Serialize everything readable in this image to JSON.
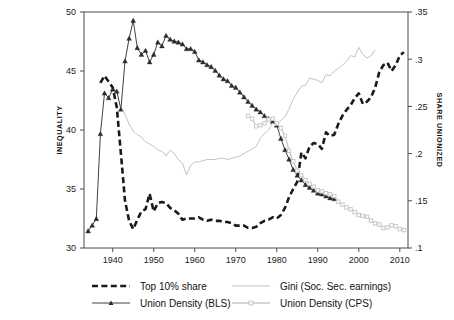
{
  "page": {
    "number": "-648-"
  },
  "chart_data": {
    "type": "line",
    "title": "",
    "subtitle": "",
    "xlabel": "",
    "ylabel": "INEQUALITY",
    "y2label": "SHARE UNIONIZED",
    "grid": false,
    "legend_position": "bottom",
    "xlim": [
      1933,
      2012
    ],
    "xticks": [
      1940,
      1950,
      1960,
      1970,
      1980,
      1990,
      2000,
      2010
    ],
    "xtick_labels": [
      "1940",
      "1950",
      "1960",
      "1970",
      "1980",
      "1990",
      "2000",
      "2010"
    ],
    "ylim": [
      30,
      50
    ],
    "yticks": [
      30,
      35,
      40,
      45,
      50
    ],
    "ytick_labels": [
      "30",
      "35",
      "40",
      "45",
      "50"
    ],
    "y2lim": [
      0.1,
      0.35
    ],
    "y2ticks": [
      0.1,
      0.15,
      0.2,
      0.25,
      0.3,
      0.35
    ],
    "y2tick_labels": [
      ".1",
      ".15",
      ".2",
      ".25",
      ".3",
      ".35"
    ],
    "series": [
      {
        "name": "Top 10% share",
        "axis": "left",
        "style": "dashed",
        "color": "#1a1a1a",
        "marker": "none",
        "x": [
          1937,
          1938,
          1939,
          1940,
          1941,
          1942,
          1943,
          1944,
          1945,
          1946,
          1947,
          1948,
          1949,
          1950,
          1951,
          1952,
          1953,
          1954,
          1955,
          1956,
          1957,
          1958,
          1959,
          1960,
          1961,
          1962,
          1963,
          1964,
          1965,
          1966,
          1967,
          1968,
          1969,
          1970,
          1971,
          1972,
          1973,
          1974,
          1975,
          1976,
          1977,
          1978,
          1979,
          1980,
          1981,
          1982,
          1983,
          1984,
          1985,
          1986,
          1987,
          1988,
          1989,
          1990,
          1991,
          1992,
          1993,
          1994,
          1995,
          1996,
          1997,
          1998,
          1999,
          2000,
          2001,
          2002,
          2003,
          2004,
          2005,
          2006,
          2007,
          2008,
          2009,
          2010,
          2011
        ],
        "y": [
          44.0,
          44.6,
          44.1,
          43.6,
          41.9,
          38.0,
          34.0,
          32.3,
          31.6,
          32.4,
          33.1,
          33.3,
          34.6,
          33.1,
          33.8,
          33.9,
          33.8,
          33.4,
          33.2,
          32.9,
          32.4,
          32.5,
          32.5,
          32.5,
          32.6,
          32.4,
          32.3,
          32.4,
          32.3,
          32.3,
          32.2,
          32.2,
          32.1,
          31.9,
          31.9,
          31.9,
          31.7,
          31.7,
          31.8,
          32.1,
          32.3,
          32.4,
          32.6,
          32.5,
          32.8,
          33.4,
          34.3,
          35.0,
          35.6,
          38.1,
          37.6,
          38.6,
          38.9,
          38.8,
          38.4,
          39.8,
          39.5,
          39.6,
          40.5,
          41.2,
          41.7,
          42.1,
          42.7,
          43.1,
          42.2,
          42.4,
          42.8,
          43.6,
          44.9,
          45.5,
          45.7,
          45.0,
          45.5,
          46.3,
          46.6
        ]
      },
      {
        "name": "Union Density (BLS)",
        "axis": "right",
        "style": "solid",
        "color": "#2b2b2b",
        "marker": "triangle",
        "x": [
          1934,
          1935,
          1936,
          1937,
          1938,
          1939,
          1940,
          1941,
          1942,
          1943,
          1944,
          1945,
          1946,
          1947,
          1948,
          1949,
          1950,
          1951,
          1952,
          1953,
          1954,
          1955,
          1956,
          1957,
          1958,
          1959,
          1960,
          1961,
          1962,
          1963,
          1964,
          1965,
          1966,
          1967,
          1968,
          1969,
          1970,
          1971,
          1972,
          1973,
          1974,
          1975,
          1976,
          1977,
          1978,
          1979,
          1980,
          1981,
          1982,
          1983,
          1984,
          1985,
          1986,
          1987,
          1988,
          1989,
          1990,
          1991,
          1992,
          1993,
          1994
        ],
        "y": [
          0.118,
          0.124,
          0.131,
          0.221,
          0.264,
          0.259,
          0.268,
          0.266,
          0.247,
          0.298,
          0.322,
          0.341,
          0.312,
          0.305,
          0.309,
          0.297,
          0.305,
          0.318,
          0.314,
          0.325,
          0.321,
          0.319,
          0.318,
          0.316,
          0.311,
          0.311,
          0.308,
          0.299,
          0.297,
          0.294,
          0.292,
          0.288,
          0.283,
          0.279,
          0.277,
          0.272,
          0.27,
          0.265,
          0.26,
          0.255,
          0.251,
          0.247,
          0.244,
          0.24,
          0.237,
          0.234,
          0.23,
          0.216,
          0.204,
          0.194,
          0.183,
          0.177,
          0.172,
          0.167,
          0.164,
          0.161,
          0.158,
          0.157,
          0.155,
          0.153,
          0.152
        ]
      },
      {
        "name": "Gini (Soc. Sec. earnings)",
        "axis": "left",
        "style": "solid-thin",
        "color": "#b4b4b4",
        "marker": "none",
        "x": [
          1942,
          1943,
          1944,
          1945,
          1946,
          1947,
          1948,
          1949,
          1950,
          1951,
          1952,
          1953,
          1954,
          1955,
          1956,
          1957,
          1958,
          1959,
          1960,
          1961,
          1962,
          1963,
          1964,
          1965,
          1966,
          1967,
          1968,
          1969,
          1970,
          1971,
          1972,
          1973,
          1974,
          1975,
          1976,
          1977,
          1978,
          1979,
          1980,
          1981,
          1982,
          1983,
          1984,
          1985,
          1986,
          1987,
          1988,
          1989,
          1990,
          1991,
          1992,
          1993,
          1994,
          1995,
          1996,
          1997,
          1998,
          1999,
          2000,
          2001,
          2002,
          2003,
          2004
        ],
        "y": [
          42.0,
          41.3,
          40.5,
          39.9,
          39.6,
          39.4,
          39.0,
          38.8,
          38.6,
          38.3,
          38.2,
          37.8,
          38.3,
          38.0,
          37.5,
          37.2,
          36.2,
          37.0,
          37.3,
          37.3,
          37.4,
          37.5,
          37.5,
          37.5,
          37.6,
          37.6,
          37.5,
          37.6,
          37.7,
          37.8,
          38.0,
          38.2,
          38.4,
          38.6,
          39.3,
          39.7,
          40.0,
          40.6,
          40.4,
          40.8,
          41.1,
          41.8,
          42.6,
          43.2,
          43.7,
          43.8,
          44.4,
          44.3,
          44.2,
          44.0,
          44.7,
          44.6,
          45.0,
          45.2,
          45.5,
          45.8,
          46.3,
          46.2,
          47.0,
          46.4,
          46.1,
          46.3,
          46.8
        ]
      },
      {
        "name": "Union Density (CPS)",
        "axis": "right",
        "style": "solid-light",
        "color": "#c9c9c9",
        "marker": "square",
        "x": [
          1973,
          1974,
          1975,
          1976,
          1977,
          1978,
          1979,
          1980,
          1981,
          1982,
          1983,
          1984,
          1985,
          1986,
          1987,
          1988,
          1989,
          1990,
          1991,
          1992,
          1993,
          1994,
          1995,
          1996,
          1997,
          1998,
          1999,
          2000,
          2001,
          2002,
          2003,
          2004,
          2005,
          2006,
          2007,
          2008,
          2009,
          2010,
          2011
        ],
        "y": [
          0.24,
          0.237,
          0.229,
          0.23,
          0.232,
          0.236,
          0.237,
          0.232,
          0.227,
          0.219,
          0.203,
          0.192,
          0.182,
          0.177,
          0.172,
          0.168,
          0.165,
          0.161,
          0.16,
          0.158,
          0.157,
          0.155,
          0.149,
          0.146,
          0.143,
          0.141,
          0.138,
          0.135,
          0.134,
          0.133,
          0.129,
          0.126,
          0.125,
          0.121,
          0.122,
          0.124,
          0.123,
          0.12,
          0.119
        ]
      }
    ],
    "legend": [
      {
        "label": "Top 10% share",
        "style": "dashed",
        "color": "#1a1a1a",
        "marker": "none"
      },
      {
        "label": "Union Density (BLS)",
        "style": "solid",
        "color": "#2b2b2b",
        "marker": "triangle"
      },
      {
        "label": "Gini (Soc. Sec. earnings)",
        "style": "solid-thin",
        "color": "#b4b4b4",
        "marker": "none"
      },
      {
        "label": "Union Density (CPS)",
        "style": "solid-light",
        "color": "#c9c9c9",
        "marker": "square"
      }
    ]
  }
}
